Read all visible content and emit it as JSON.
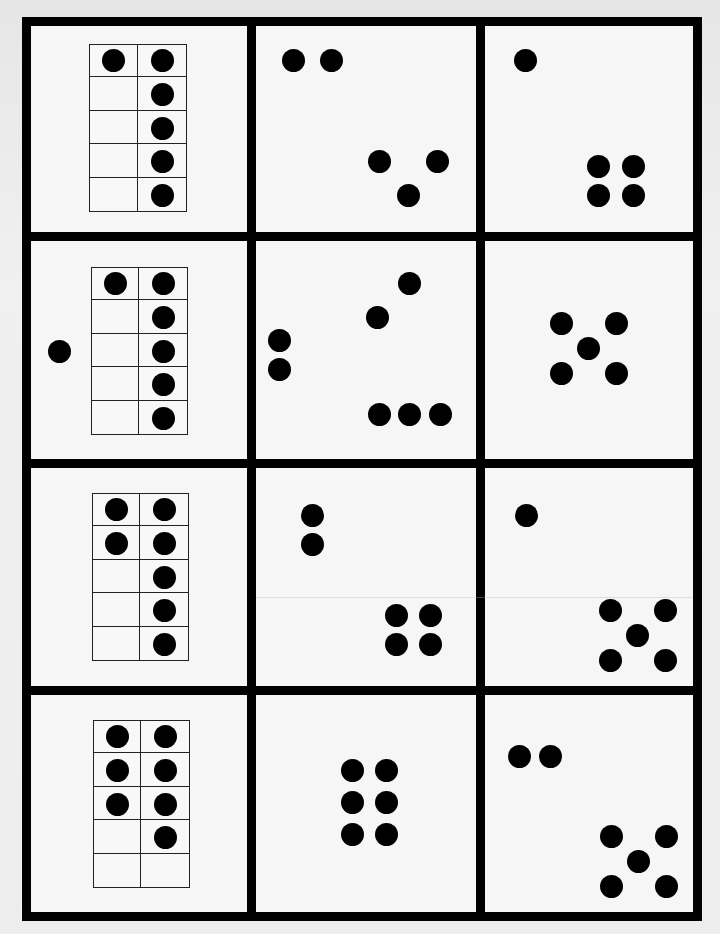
{
  "worksheet": {
    "title": "Ten-frame and dot pattern matching cards",
    "rows": 4,
    "columns": 3,
    "colors": {
      "line": "#000000",
      "dot": "#000000",
      "card_background": "#f6f6f6",
      "page_background": "#ebebeb"
    },
    "grid": {
      "outer_left": 22,
      "outer_top": 17,
      "outer_right": 702,
      "outer_bottom": 921,
      "line_width": 9,
      "col_bounds": [
        [
          31,
          247
        ],
        [
          256,
          476
        ],
        [
          485,
          693
        ]
      ],
      "row_bounds": [
        [
          26,
          232
        ],
        [
          241,
          459
        ],
        [
          468,
          686
        ],
        [
          695,
          912
        ]
      ]
    },
    "dot_diameter": 23,
    "cards": [
      {
        "row": 0,
        "col": 0,
        "type": "ten-frame",
        "count": 6,
        "frame": {
          "x": 89,
          "y": 44,
          "w": 98,
          "h": 168
        },
        "filled_cells": [
          [
            0,
            0
          ],
          [
            0,
            1
          ],
          [
            1,
            1
          ],
          [
            2,
            1
          ],
          [
            3,
            1
          ],
          [
            4,
            1
          ]
        ],
        "extra_dots": []
      },
      {
        "row": 0,
        "col": 1,
        "type": "dot-pattern",
        "count": 5,
        "dots": [
          [
            293,
            60
          ],
          [
            331,
            60
          ],
          [
            379,
            161
          ],
          [
            437,
            161
          ],
          [
            408,
            195
          ]
        ]
      },
      {
        "row": 0,
        "col": 2,
        "type": "dot-pattern",
        "count": 5,
        "dots": [
          [
            525,
            60
          ],
          [
            598,
            166
          ],
          [
            633,
            166
          ],
          [
            598,
            195
          ],
          [
            633,
            195
          ]
        ]
      },
      {
        "row": 1,
        "col": 0,
        "type": "ten-frame",
        "count": 7,
        "frame": {
          "x": 91,
          "y": 267,
          "w": 97,
          "h": 168
        },
        "filled_cells": [
          [
            0,
            0
          ],
          [
            0,
            1
          ],
          [
            1,
            1
          ],
          [
            2,
            1
          ],
          [
            3,
            1
          ],
          [
            4,
            1
          ]
        ],
        "extra_dots": [
          [
            59,
            351
          ]
        ]
      },
      {
        "row": 1,
        "col": 1,
        "type": "dot-pattern",
        "count": 7,
        "dots": [
          [
            409,
            283
          ],
          [
            377,
            317
          ],
          [
            279,
            340
          ],
          [
            279,
            369
          ],
          [
            379,
            414
          ],
          [
            409,
            414
          ],
          [
            440,
            414
          ]
        ]
      },
      {
        "row": 1,
        "col": 2,
        "type": "dot-pattern",
        "count": 5,
        "dots": [
          [
            561,
            323
          ],
          [
            616,
            323
          ],
          [
            588,
            348
          ],
          [
            561,
            373
          ],
          [
            616,
            373
          ]
        ]
      },
      {
        "row": 2,
        "col": 0,
        "type": "ten-frame",
        "count": 7,
        "frame": {
          "x": 92,
          "y": 493,
          "w": 97,
          "h": 168
        },
        "filled_cells": [
          [
            0,
            0
          ],
          [
            0,
            1
          ],
          [
            1,
            0
          ],
          [
            1,
            1
          ],
          [
            2,
            1
          ],
          [
            3,
            1
          ],
          [
            4,
            1
          ]
        ],
        "extra_dots": []
      },
      {
        "row": 2,
        "col": 1,
        "type": "dot-pattern",
        "count": 6,
        "dots": [
          [
            312,
            515
          ],
          [
            312,
            544
          ],
          [
            396,
            615
          ],
          [
            430,
            615
          ],
          [
            396,
            644
          ],
          [
            430,
            644
          ]
        ]
      },
      {
        "row": 2,
        "col": 2,
        "type": "dot-pattern",
        "count": 6,
        "dots": [
          [
            526,
            515
          ],
          [
            610,
            610
          ],
          [
            665,
            610
          ],
          [
            637,
            635
          ],
          [
            610,
            660
          ],
          [
            665,
            660
          ]
        ]
      },
      {
        "row": 3,
        "col": 0,
        "type": "ten-frame",
        "count": 7,
        "frame": {
          "x": 93,
          "y": 720,
          "w": 97,
          "h": 168
        },
        "filled_cells": [
          [
            0,
            0
          ],
          [
            0,
            1
          ],
          [
            1,
            0
          ],
          [
            1,
            1
          ],
          [
            2,
            0
          ],
          [
            2,
            1
          ],
          [
            3,
            1
          ]
        ],
        "extra_dots": []
      },
      {
        "row": 3,
        "col": 1,
        "type": "dot-pattern",
        "count": 6,
        "dots": [
          [
            352,
            770
          ],
          [
            386,
            770
          ],
          [
            352,
            802
          ],
          [
            386,
            802
          ],
          [
            352,
            834
          ],
          [
            386,
            834
          ]
        ]
      },
      {
        "row": 3,
        "col": 2,
        "type": "dot-pattern",
        "count": 7,
        "dots": [
          [
            519,
            756
          ],
          [
            550,
            756
          ],
          [
            611,
            836
          ],
          [
            666,
            836
          ],
          [
            638,
            861
          ],
          [
            611,
            886
          ],
          [
            666,
            886
          ]
        ]
      }
    ]
  }
}
